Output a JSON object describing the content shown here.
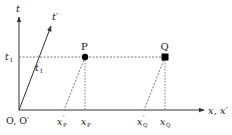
{
  "diagram": {
    "colors": {
      "line": "#333333",
      "dashed": "#555555",
      "point": "#000000"
    },
    "axes": {
      "t": {
        "label": "t"
      },
      "t_prime": {
        "label": "t′"
      },
      "x": {
        "label": "x, x′"
      },
      "origin": {
        "label": "O, O′"
      }
    },
    "time_marks": {
      "t1": {
        "label": "t",
        "sub": "1"
      },
      "t1_prime": {
        "label": "t",
        "sup": "′",
        "sub": "1"
      }
    },
    "points": [
      {
        "id": "P",
        "label": "P",
        "marker": "circle"
      },
      {
        "id": "Q",
        "label": "Q",
        "marker": "square"
      }
    ],
    "x_ticks": [
      {
        "label": "x",
        "sup": "′",
        "sub": "P"
      },
      {
        "label": "x",
        "sup": "",
        "sub": "P"
      },
      {
        "label": "x",
        "sup": "′",
        "sub": "Q"
      },
      {
        "label": "x",
        "sup": "",
        "sub": "Q"
      }
    ]
  }
}
